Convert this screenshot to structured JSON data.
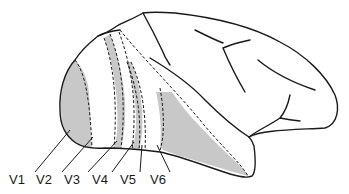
{
  "diagram": {
    "fill_color": "#c8c8c8",
    "stroke_color": "#1a1a1a",
    "labels": [
      {
        "id": "V1",
        "text": "V1",
        "x": 9,
        "y": 179
      },
      {
        "id": "V2",
        "text": "V2",
        "x": 36,
        "y": 179
      },
      {
        "id": "V3",
        "text": "V3",
        "x": 64,
        "y": 179
      },
      {
        "id": "V4",
        "text": "V4",
        "x": 92,
        "y": 179
      },
      {
        "id": "V5",
        "text": "V5",
        "x": 118,
        "y": 179
      },
      {
        "id": "V6",
        "text": "V6",
        "x": 145,
        "y": 179
      }
    ]
  }
}
